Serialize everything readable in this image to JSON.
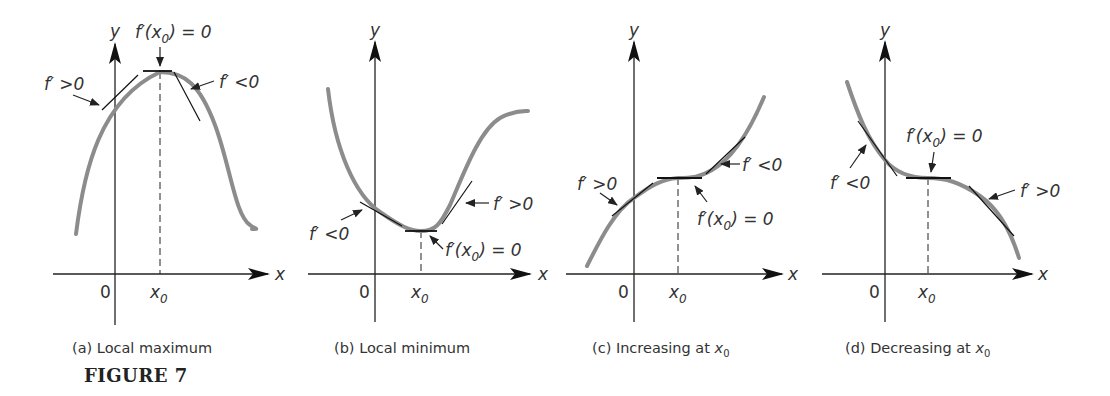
{
  "figure": {
    "label": "FIGURE 7"
  },
  "axis_labels": {
    "x": "x",
    "y": "y",
    "origin": "0",
    "x0": "x",
    "x0_sub": "0"
  },
  "panels": [
    {
      "id": "a",
      "caption_prefix": "(a) Local maximum",
      "caption_var": "",
      "caption_sub": "",
      "annotations": {
        "left": "f′ >0",
        "center_fn": "f′(x",
        "center_sub": "0",
        "center_eq": ") = 0",
        "right": "f′ <0"
      }
    },
    {
      "id": "b",
      "caption_prefix": "(b) Local minimum",
      "caption_var": "",
      "caption_sub": "",
      "annotations": {
        "left": "f′ <0",
        "center_fn": "f′(x",
        "center_sub": "0",
        "center_eq": ") = 0",
        "right": "f′ >0"
      }
    },
    {
      "id": "c",
      "caption_prefix": "(c) Increasing at ",
      "caption_var": "x",
      "caption_sub": "0",
      "annotations": {
        "left": "f′ >0",
        "center_fn": "f′(x",
        "center_sub": "0",
        "center_eq": ") = 0",
        "right": "f′ <0"
      }
    },
    {
      "id": "d",
      "caption_prefix": "(d) Decreasing at ",
      "caption_var": "x",
      "caption_sub": "0",
      "annotations": {
        "left": "f′ <0",
        "center_fn": "f′(x",
        "center_sub": "0",
        "center_eq": ") = 0",
        "right": "f′ >0"
      }
    }
  ],
  "colors": {
    "curve": "#8c8c8c",
    "axis": "#222222",
    "tangent": "#111111",
    "text": "#333333"
  }
}
